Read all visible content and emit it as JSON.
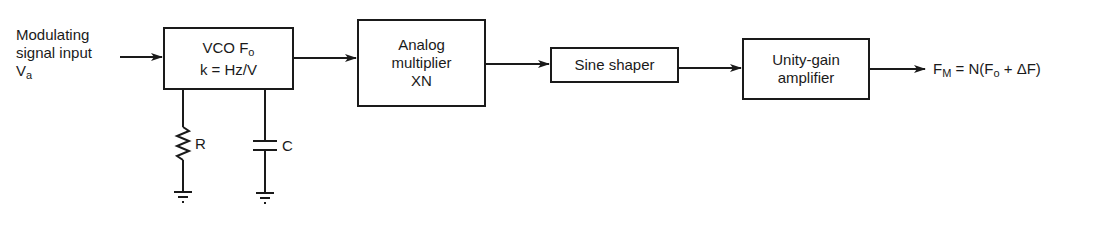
{
  "input": {
    "line1": "Modulating",
    "line2": "signal input",
    "symbol": "V",
    "symbol_sub": "a"
  },
  "blocks": [
    {
      "id": "vco",
      "line1_main": "VCO F",
      "line1_sub": "o",
      "line2": "k = Hz/V"
    },
    {
      "id": "analog-multiplier",
      "line1": "Analog",
      "line2": "multiplier",
      "line3": "XN"
    },
    {
      "id": "sine-shaper",
      "line1": "Sine shaper"
    },
    {
      "id": "unity-gain-amplifier",
      "line1": "Unity-gain",
      "line2": "amplifier"
    }
  ],
  "components": {
    "resistor_label": "R",
    "capacitor_label": "C"
  },
  "output": {
    "f": "F",
    "f_sub": "M",
    "eq_mid": " = N(F",
    "fo_sub": "o",
    "eq_end": " + ΔF)"
  }
}
